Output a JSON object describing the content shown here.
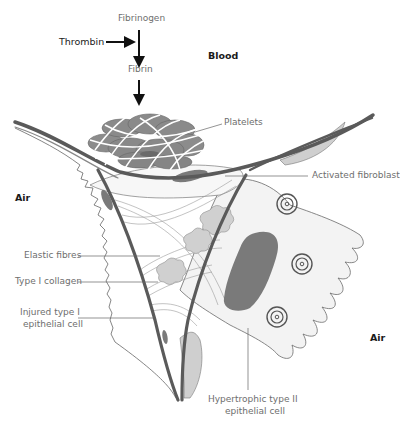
{
  "diagram": {
    "title": "",
    "pathway": {
      "fibrinogen": "Fibrinogen",
      "thrombin": "Thrombin",
      "fibrin": "Fibrin"
    },
    "regions": {
      "blood": "Blood",
      "air_left": "Air",
      "air_right": "Air"
    },
    "labels": {
      "platelets": "Platelets",
      "activated_fibroblast": "Activated fibroblast",
      "elastic_fibres": "Elastic fibres",
      "type1_collagen": "Type I collagen",
      "injured_type1_line1": "Injured type I",
      "injured_type1_line2": "epithelial cell",
      "hypertrophic_line1": "Hypertrophic type II",
      "hypertrophic_line2": "epithelial cell"
    },
    "colors": {
      "membrane": "#5a5a5a",
      "platelet": "#8a8a8a",
      "nucleus": "#7a7a7a",
      "elastic": "#cfcfcf",
      "cell_fill": "#f2f2f2",
      "text_light": "#6e6e6e",
      "text_dark": "#1a1a1a"
    }
  }
}
